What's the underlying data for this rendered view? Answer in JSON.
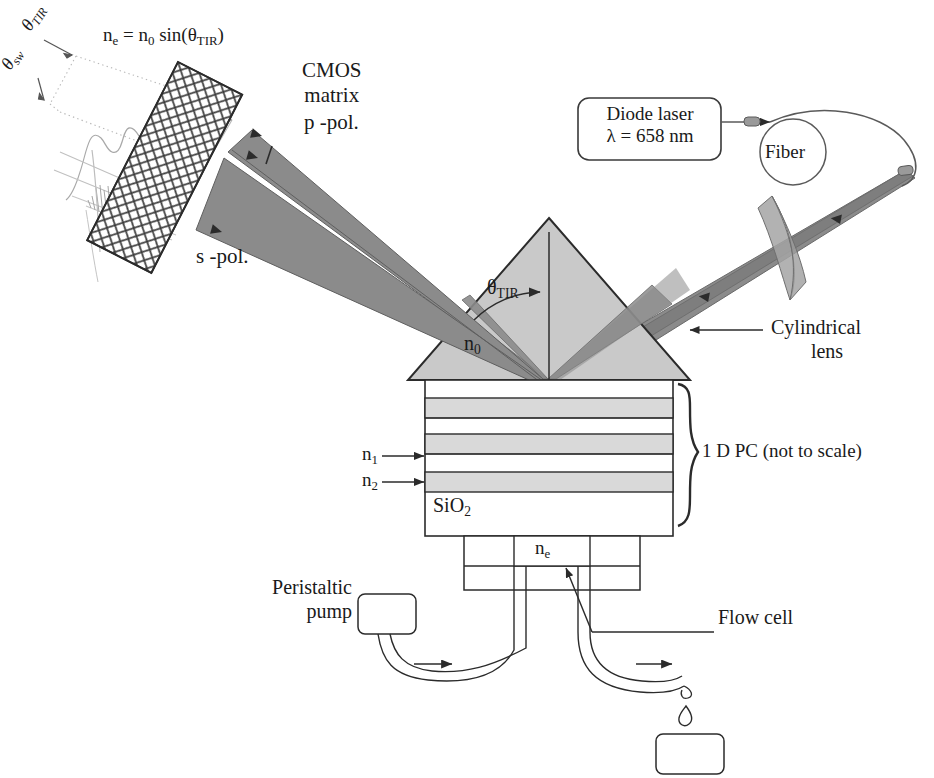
{
  "figure": {
    "kind": "optical-biosensor-schematic"
  },
  "labels": {
    "equation": "n<sub>e</sub> = n<sub>0</sub> sin(θ<sub>TIR</sub>)",
    "theta_tir_axis": "θ<sub>TIR</sub>",
    "theta_sw_axis": "θ<sub>sw</sub>",
    "cmos_line1": "CMOS",
    "cmos_line2": "matrix",
    "p_pol": "p -pol.",
    "s_pol": "s -pol.",
    "diode_line1": "Diode laser",
    "diode_line2": "λ = 658 nm",
    "fiber": "Fiber",
    "cyl_line1": "Cylindrical",
    "cyl_line2": "lens",
    "theta_tir_prism": "θ<sub>TIR</sub>",
    "n0": "n<sub>0</sub>",
    "n1": "n<sub>1</sub>",
    "n2": "n<sub>2</sub>",
    "sio2": "SiO<sub>2</sub>",
    "one_d_pc": "1 D PC (not to scale)",
    "ne_flowcell": "n<sub>e</sub>",
    "pump_line1": "Peristaltic",
    "pump_line2": "pump",
    "flow_cell": "Flow cell"
  },
  "values": {
    "wavelength_nm": 658,
    "wavelength_symbol": "λ",
    "pc_periods": 3,
    "cmos_grid_cols": 6,
    "cmos_grid_rows": 17
  },
  "colors": {
    "beam_gray": "#8b8b8b",
    "beam_dark": "#6f6f6f",
    "prism_fill": "#c9c9c9",
    "layer_high": "#d9d9d9",
    "layer_low": "#ffffff",
    "lens_fill": "#b3b3b3",
    "outline": "#2b2b2b",
    "faint_sketch": "#b6b6b6",
    "background": "#ffffff"
  }
}
